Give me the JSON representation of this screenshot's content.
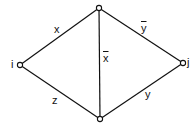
{
  "diagram": {
    "type": "graph",
    "nodes": [
      {
        "id": "i",
        "label": "i",
        "x": 20,
        "y": 65
      },
      {
        "id": "top",
        "label": "",
        "x": 99,
        "y": 8
      },
      {
        "id": "j",
        "label": "j",
        "x": 183,
        "y": 63
      },
      {
        "id": "bottom",
        "label": "",
        "x": 100,
        "y": 119
      }
    ],
    "edges": [
      {
        "from": "i",
        "to": "top",
        "label": "x"
      },
      {
        "from": "top",
        "to": "j",
        "label": "y̅"
      },
      {
        "from": "top",
        "to": "bottom",
        "label": "x̅"
      },
      {
        "from": "i",
        "to": "bottom",
        "label": "z"
      },
      {
        "from": "bottom",
        "to": "j",
        "label": "y"
      }
    ],
    "labels": {
      "node_i": "i",
      "node_j": "j",
      "edge_x": "x",
      "edge_ybar": "y",
      "edge_xbar": "x",
      "edge_z": "z",
      "edge_y": "y"
    }
  }
}
